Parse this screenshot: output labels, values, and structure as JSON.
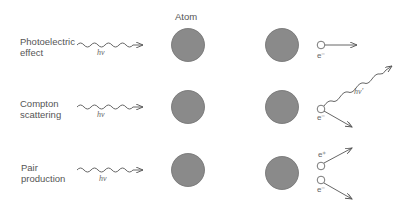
{
  "header": {
    "atom_label": "Atom"
  },
  "rows": [
    {
      "process": "Photoelectric effect",
      "line1": "Photoelectric",
      "line2": "effect",
      "incident": "hν",
      "products": [
        "e⁻"
      ]
    },
    {
      "process": "Compton scattering",
      "line1": "Compton",
      "line2": "scattering",
      "incident": "hν",
      "products": [
        "hν′",
        "e⁻"
      ]
    },
    {
      "process": "Pair production",
      "line1": "Pair",
      "line2": "production",
      "incident": "hν",
      "products": [
        "e⁺",
        "e⁻"
      ]
    }
  ],
  "colors": {
    "atom_fill": "#8a8a8a",
    "atom_stroke": "#6e6e6e",
    "line": "#555555",
    "text": "#555555"
  }
}
